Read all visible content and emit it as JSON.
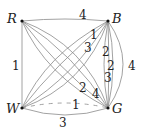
{
  "graph": {
    "vertices": [
      {
        "id": "R",
        "label": "R",
        "x": 22,
        "y": 21
      },
      {
        "id": "B",
        "label": "B",
        "x": 108,
        "y": 21
      },
      {
        "id": "W",
        "label": "W",
        "x": 22,
        "y": 108
      },
      {
        "id": "G",
        "label": "G",
        "x": 108,
        "y": 108
      }
    ],
    "edges": [
      {
        "from": "R",
        "to": "B",
        "weight": "4"
      },
      {
        "from": "R",
        "to": "W",
        "weight": "1"
      },
      {
        "from": "W",
        "to": "G",
        "weight": "3"
      },
      {
        "from": "W",
        "to": "G",
        "weight": "1",
        "style": "dashed"
      },
      {
        "from": "B",
        "to": "G",
        "weight": "4"
      },
      {
        "from": "B",
        "to": "G",
        "weight": "2"
      },
      {
        "from": "B",
        "to": "G",
        "weight": "2"
      },
      {
        "from": "B",
        "to": "G",
        "weight": "3"
      },
      {
        "from": "W",
        "to": "B",
        "weight": "1"
      },
      {
        "from": "W",
        "to": "B",
        "weight": "3"
      },
      {
        "from": "R",
        "to": "G",
        "weight": "2"
      },
      {
        "from": "R",
        "to": "G",
        "weight": "4"
      }
    ]
  },
  "labels": {
    "R": "R",
    "B": "B",
    "W": "W",
    "G": "G",
    "rb": "4",
    "rw": "1",
    "wg": "3",
    "wg_dashed": "1",
    "bg_outer": "4",
    "bg1": "2",
    "bg2": "2",
    "bg3": "3",
    "wb1": "1",
    "wb2": "3",
    "rg1": "2",
    "rg2": "4"
  }
}
